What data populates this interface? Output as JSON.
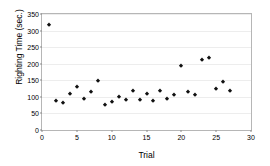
{
  "chart_data": {
    "type": "scatter",
    "title": "",
    "xlabel": "Trial",
    "ylabel": "Righting Time (sec.)",
    "xlim": [
      0,
      30
    ],
    "ylim": [
      0,
      350
    ],
    "xticks": [
      0,
      5,
      10,
      15,
      20,
      25,
      30
    ],
    "yticks": [
      0,
      50,
      100,
      150,
      200,
      250,
      300,
      350
    ],
    "grid": true,
    "grid_axis": "y",
    "legend": false,
    "marker": "diamond",
    "marker_color": "#111111",
    "series": [
      {
        "name": "Righting Time",
        "x": [
          1,
          2,
          3,
          4,
          5,
          6,
          7,
          8,
          9,
          10,
          11,
          12,
          13,
          14,
          15,
          16,
          17,
          18,
          19,
          20,
          21,
          22,
          23,
          24,
          25,
          26,
          27
        ],
        "values": [
          318,
          88,
          81,
          108,
          130,
          94,
          114,
          149,
          74,
          83,
          101,
          92,
          117,
          91,
          110,
          88,
          118,
          94,
          105,
          193,
          116,
          106,
          211,
          218,
          125,
          145,
          119
        ]
      }
    ]
  },
  "axes": {
    "y_title": "Righting Time (sec.)",
    "x_title": "Trial",
    "y_tick_labels": [
      "0",
      "50",
      "100",
      "150",
      "200",
      "250",
      "300",
      "350"
    ],
    "x_tick_labels": [
      "0",
      "5",
      "10",
      "15",
      "20",
      "25",
      "30"
    ]
  },
  "colors": {
    "marker": "#111111",
    "gridline": "#ededed",
    "frame": "#b6b6b6",
    "background": "#ffffff"
  }
}
